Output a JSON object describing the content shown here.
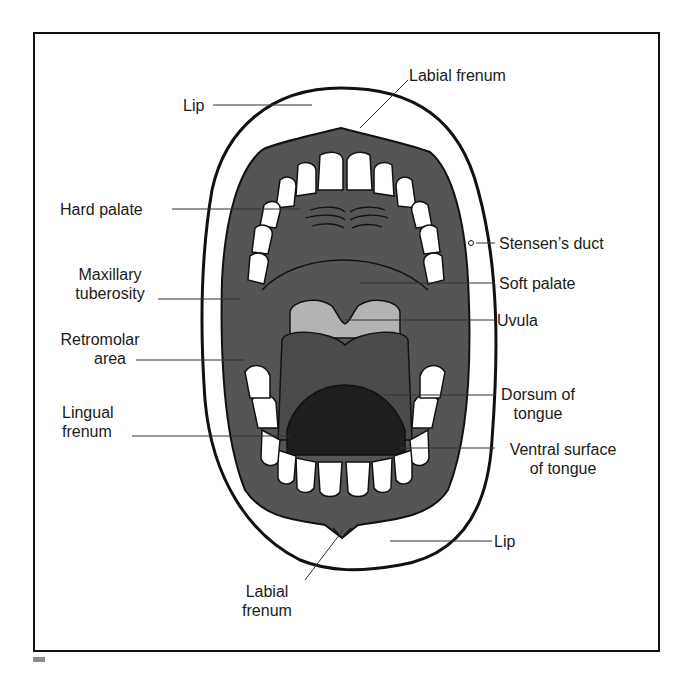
{
  "figure": {
    "colors": {
      "background": "#ffffff",
      "frame": "#111111",
      "mucosa": "#555555",
      "tongue": "#4a4a4a",
      "tongue_ventral": "#1e1e1e",
      "uvula_area": "#b3b3b3",
      "teeth": "#ffffff",
      "outline": "#111111",
      "leader_line": "#333333"
    }
  },
  "labels": {
    "labial_frenum_top": "Labial frenum",
    "lip_top": "Lip",
    "hard_palate": "Hard palate",
    "stensens_duct": "Stensen’s duct",
    "maxillary_tuberosity_1": "Maxillary",
    "maxillary_tuberosity_2": "tuberosity",
    "soft_palate": "Soft palate",
    "retromolar_area_1": "Retromolar",
    "retromolar_area_2": "area",
    "uvula": "Uvula",
    "dorsum_of_tongue_1": "Dorsum of",
    "dorsum_of_tongue_2": "tongue",
    "lingual_frenum_1": "Lingual",
    "lingual_frenum_2": "frenum",
    "ventral_surface_1": "Ventral surface",
    "ventral_surface_2": "of tongue",
    "lip_bottom": "Lip",
    "labial_frenum_bottom_1": "Labial",
    "labial_frenum_bottom_2": "frenum"
  }
}
